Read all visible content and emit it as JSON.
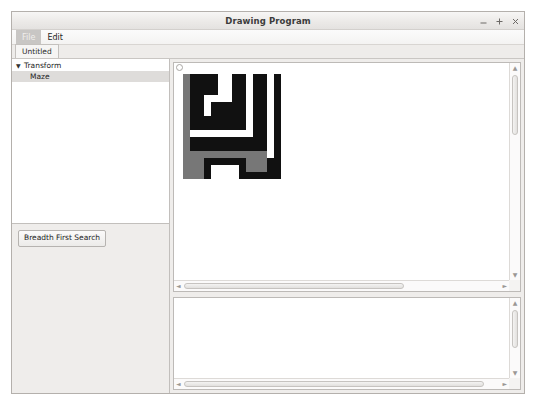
{
  "window": {
    "title": "Drawing Program",
    "controls": [
      {
        "name": "minimize-button",
        "glyph": "minimize"
      },
      {
        "name": "maximize-button",
        "glyph": "maximize"
      },
      {
        "name": "close-button",
        "glyph": "close"
      }
    ]
  },
  "menu": {
    "items": [
      {
        "label": "File",
        "active": true
      },
      {
        "label": "Edit",
        "active": false
      }
    ]
  },
  "tabs": [
    {
      "label": "Untitled",
      "selected": true
    }
  ],
  "sidebar": {
    "tree": [
      {
        "label": "Transform",
        "level": 0,
        "expanded": true,
        "arrow": "▼",
        "selected": false
      },
      {
        "label": "Maze",
        "level": 1,
        "expanded": false,
        "arrow": "",
        "selected": true
      }
    ],
    "tools": {
      "bfs_button_label": "Breadth First Search"
    }
  },
  "canvas": {
    "scroll": {
      "v_arrow_up": "▲",
      "v_arrow_down": "▼",
      "h_arrow_left": "◄",
      "h_arrow_right": "►"
    },
    "maze": {
      "cell_px": 7,
      "cols": 14,
      "rows": 15,
      "colors": {
        "wall": "#111111",
        "path": "#ffffff",
        "visited": "#777777"
      },
      "legend": {
        "0": "path",
        "1": "wall",
        "2": "visited"
      },
      "grid": [
        [
          2,
          1,
          1,
          1,
          1,
          0,
          0,
          1,
          1,
          0,
          1,
          1,
          0,
          1
        ],
        [
          2,
          1,
          1,
          1,
          1,
          0,
          0,
          1,
          1,
          0,
          1,
          1,
          0,
          1
        ],
        [
          2,
          1,
          1,
          1,
          1,
          0,
          0,
          1,
          1,
          0,
          1,
          1,
          0,
          1
        ],
        [
          2,
          1,
          1,
          0,
          0,
          0,
          0,
          1,
          1,
          0,
          1,
          1,
          0,
          1
        ],
        [
          2,
          1,
          1,
          0,
          1,
          1,
          1,
          1,
          1,
          0,
          1,
          1,
          0,
          1
        ],
        [
          2,
          1,
          1,
          0,
          1,
          1,
          1,
          1,
          1,
          0,
          1,
          1,
          0,
          1
        ],
        [
          2,
          1,
          1,
          1,
          1,
          1,
          1,
          1,
          1,
          0,
          1,
          1,
          0,
          1
        ],
        [
          2,
          1,
          1,
          1,
          1,
          1,
          1,
          1,
          1,
          0,
          1,
          1,
          0,
          1
        ],
        [
          2,
          0,
          0,
          0,
          0,
          0,
          0,
          0,
          0,
          0,
          1,
          1,
          0,
          1
        ],
        [
          2,
          1,
          1,
          1,
          1,
          1,
          1,
          1,
          1,
          1,
          1,
          1,
          0,
          1
        ],
        [
          2,
          1,
          1,
          1,
          1,
          1,
          1,
          1,
          1,
          1,
          1,
          1,
          0,
          1
        ],
        [
          2,
          2,
          2,
          2,
          2,
          2,
          2,
          2,
          2,
          2,
          2,
          2,
          0,
          1
        ],
        [
          2,
          2,
          2,
          1,
          1,
          1,
          1,
          1,
          1,
          2,
          2,
          2,
          1,
          1
        ],
        [
          2,
          2,
          2,
          1,
          0,
          0,
          0,
          0,
          1,
          2,
          2,
          2,
          1,
          1
        ],
        [
          2,
          2,
          2,
          1,
          0,
          0,
          0,
          0,
          1,
          1,
          1,
          1,
          1,
          1
        ]
      ]
    }
  },
  "console": {
    "scroll": {
      "v_arrow_up": "▲",
      "v_arrow_down": "▼",
      "h_arrow_left": "◄",
      "h_arrow_right": "►"
    },
    "text": ""
  }
}
